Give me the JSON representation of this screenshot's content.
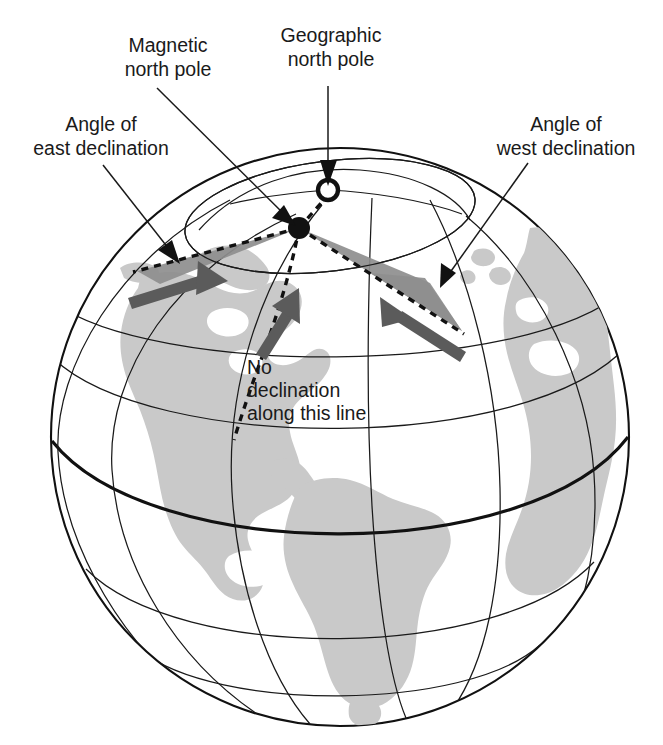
{
  "figure": {
    "type": "annotated-globe-diagram"
  },
  "labels": {
    "magnetic_pole": {
      "line1": "Magnetic",
      "line2": "north pole"
    },
    "geographic_pole": {
      "line1": "Geographic",
      "line2": "north pole"
    },
    "east_declination": {
      "line1": "Angle of",
      "line2": "east declination"
    },
    "west_declination": {
      "line1": "Angle of",
      "line2": "west declination"
    },
    "no_declination": {
      "line1": "No",
      "line2": "declination",
      "line3": "along this line"
    }
  },
  "markers": {
    "geographic_north_pole": {
      "name": "open-circle",
      "x": 328,
      "y": 190
    },
    "magnetic_north_pole": {
      "name": "filled-circle",
      "x": 299,
      "y": 228
    }
  },
  "colors": {
    "land": "#c9c9c9",
    "wedge": "#8e8e8e",
    "arrow": "#5b5b5b",
    "line": "#111111",
    "background": "#ffffff"
  },
  "icons": {
    "magnetic_pole_dot": "filled-dot-icon",
    "geographic_pole_dot": "open-dot-icon",
    "compass_arrow_east": "arrow-up-right-icon",
    "compass_arrow_center": "arrow-up-icon",
    "compass_arrow_west": "arrow-up-left-icon"
  }
}
